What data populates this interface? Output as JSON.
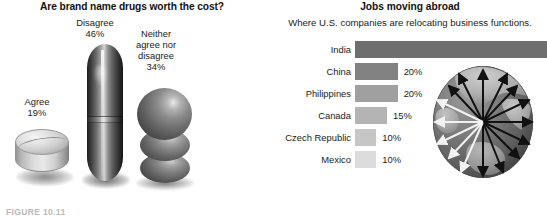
{
  "figure": {
    "caption": "FIGURE 10.11"
  },
  "left_chart": {
    "title": "Are brand name drugs worth the cost?",
    "items": [
      {
        "label": "Agree",
        "value_label": "19%",
        "value": 19,
        "icon": "round-tablet-icon"
      },
      {
        "label": "Disagree",
        "value_label": "46%",
        "value": 46,
        "icon": "capsule-pill-icon"
      },
      {
        "label": "Neither\nagree nor\ndisagree",
        "value_label": "34%",
        "value": 34,
        "icon": "stacked-spheres-icon"
      }
    ],
    "label_agree": "Agree",
    "value_agree": "19%",
    "label_disagree": "Disagree",
    "value_disagree": "46%",
    "label_neither_l1": "Neither",
    "label_neither_l2": "agree nor",
    "label_neither_l3": "disagree",
    "value_neither": "34%"
  },
  "right_chart": {
    "title": "Jobs moving abroad",
    "subtitle": "Where U.S. companies are relocating business functions.",
    "globe_icon": "globe-with-radiating-arrows-icon"
  },
  "chart_data": [
    {
      "type": "pie",
      "title": "Are brand name drugs worth the cost?",
      "xlabel": "",
      "ylabel": "",
      "categories": [
        "Agree",
        "Disagree",
        "Neither agree nor disagree"
      ],
      "values": [
        19,
        46,
        34
      ],
      "value_labels": [
        "19%",
        "46%",
        "34%"
      ],
      "units": "percent",
      "legend": "none",
      "grid": false,
      "note": "Pictograph: each category rendered as a 3D pill graphic sized by its percentage."
    },
    {
      "type": "bar",
      "title": "Jobs moving abroad",
      "subtitle": "Where U.S. companies are relocating business functions.",
      "orientation": "horizontal",
      "xlabel": "",
      "ylabel": "",
      "categories": [
        "India",
        "China",
        "Philippines",
        "Canada",
        "Czech Republic",
        "Mexico"
      ],
      "values": [
        90,
        20,
        20,
        15,
        10,
        10
      ],
      "value_labels": [
        "90%",
        "20%",
        "20%",
        "15%",
        "10%",
        "10%"
      ],
      "bar_colors": [
        "#6e6e6e",
        "#828282",
        "#a0a0a0",
        "#b4b4b4",
        "#c6c6c6",
        "#dcdcdc"
      ],
      "xlim": [
        0,
        90
      ],
      "grid": false,
      "legend": "none",
      "units": "percent"
    }
  ]
}
